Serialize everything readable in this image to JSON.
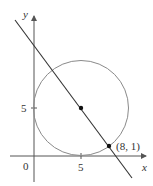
{
  "diagram": {
    "type": "coordinate-geometry",
    "axes": {
      "x_label": "x",
      "y_label": "y",
      "origin_label": "0",
      "x_tick_label": "5",
      "y_tick_label": "5"
    },
    "circle": {
      "center": [
        5,
        5
      ],
      "radius": 5,
      "stroke": "#8a8a8a"
    },
    "line": {
      "through": [
        [
          5,
          5
        ],
        [
          8,
          1
        ]
      ],
      "stroke": "#333333"
    },
    "points": [
      {
        "coords": [
          5,
          5
        ],
        "label": ""
      },
      {
        "coords": [
          8,
          1
        ],
        "label": "(8, 1)"
      }
    ],
    "colors": {
      "axis": "#555555",
      "point": "#111111",
      "text": "#333333"
    }
  }
}
